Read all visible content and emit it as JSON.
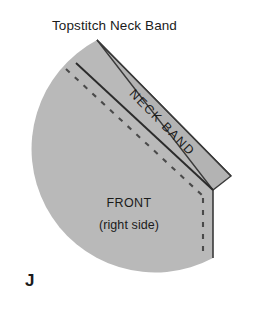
{
  "figure": {
    "title": "Topstitch Neck Band",
    "letter": "J",
    "width": 276,
    "height": 310,
    "background": "#ffffff"
  },
  "labels": {
    "neck_band": "NECK BAND",
    "front": "FRONT",
    "right_side": "(right side)"
  },
  "colors": {
    "fabric_fill": "#b9b9b9",
    "band_fill": "#b3b3b3",
    "outline": "#3a3a3a",
    "seam_line": "#2b2b2b",
    "stitch_dash": "#4a4a4a",
    "text": "#1b1b1b",
    "background": "#ffffff"
  },
  "geometry": {
    "front_piece_note": "quarter-circle front bodice, right side up",
    "band_note": "diagonal neck band strip folded at right point",
    "seam_line_note": "solid diagonal seam joining band to front",
    "stitch_line_note": "dashed topstitching line parallel to seam"
  }
}
